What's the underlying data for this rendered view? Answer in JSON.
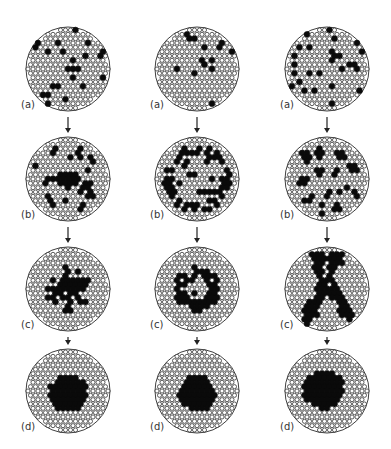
{
  "figure": {
    "colors": {
      "lattice_line": "#2a2a2a",
      "atom_fill": "#ffffff",
      "solute": "#0a0a0a",
      "background": "#ffffff"
    },
    "columns": [
      {
        "id": "col1",
        "cx": 68,
        "panels": [
          {
            "stage": "a",
            "label": "(a)",
            "cy": 69,
            "pattern": "random"
          },
          {
            "stage": "b",
            "label": "(b)",
            "cy": 179,
            "pattern": "center-nucleus-with-halo"
          },
          {
            "stage": "c",
            "label": "(c)",
            "cy": 289,
            "pattern": "growing-nucleus"
          },
          {
            "stage": "d",
            "label": "(d)",
            "cy": 391,
            "pattern": "compact-cluster"
          }
        ]
      },
      {
        "id": "col2",
        "cx": 197,
        "panels": [
          {
            "stage": "a",
            "label": "(a)",
            "cy": 69,
            "pattern": "random"
          },
          {
            "stage": "b",
            "label": "(b)",
            "cy": 179,
            "pattern": "ring"
          },
          {
            "stage": "c",
            "label": "(c)",
            "cy": 289,
            "pattern": "shrinking-ring"
          },
          {
            "stage": "d",
            "label": "(d)",
            "cy": 391,
            "pattern": "compact-cluster"
          }
        ]
      },
      {
        "id": "col3",
        "cx": 327,
        "panels": [
          {
            "stage": "a",
            "label": "(a)",
            "cy": 69,
            "pattern": "random"
          },
          {
            "stage": "b",
            "label": "(b)",
            "cy": 179,
            "pattern": "small-clusters"
          },
          {
            "stage": "c",
            "label": "(c)",
            "cy": 289,
            "pattern": "branched-network"
          },
          {
            "stage": "d",
            "label": "(d)",
            "cy": 391,
            "pattern": "compact-cluster-offset"
          }
        ]
      }
    ],
    "radius": 42,
    "arrow_glyph": "down-arrow"
  }
}
